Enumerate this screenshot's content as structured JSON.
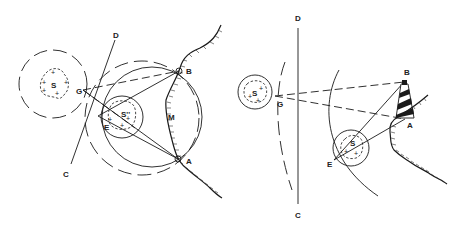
{
  "figure": {
    "left_panel": {
      "name": "Danger circle navigation (two-point horizontal angle)",
      "labels": {
        "S": "S",
        "S2": "S''",
        "G": "G",
        "E": "E",
        "D": "D",
        "C": "C",
        "B": "B",
        "A": "A",
        "M": "M"
      }
    },
    "right_panel": {
      "name": "Danger angle with lighthouse",
      "labels": {
        "S": "S",
        "S2": "S",
        "G": "G",
        "E": "E",
        "D": "D",
        "C": "C",
        "B": "B",
        "A": "A"
      }
    },
    "shoal_marks": [
      "+",
      "+",
      "+",
      "+",
      "+"
    ],
    "colors": {
      "ink": "#1a1a1a",
      "background": "#ffffff"
    }
  }
}
